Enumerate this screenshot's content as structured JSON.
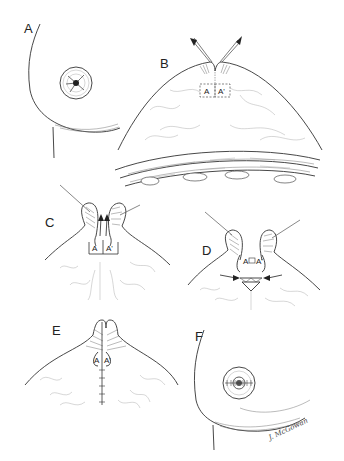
{
  "figure": {
    "panels": [
      {
        "id": "A",
        "label": "A",
        "content": "Breast with inverted nipple (frontal/oblique view)"
      },
      {
        "id": "B",
        "label": "B",
        "content": "Cross-section; nipple elevated with traction sutures (arrows); flaps A and A' outlined (dashed)",
        "flap_labels": [
          "A",
          "A'"
        ]
      },
      {
        "id": "C",
        "label": "C",
        "content": "Flaps A and A' raised, arrows showing advancement upward",
        "flap_labels": [
          "A",
          "A'"
        ]
      },
      {
        "id": "D",
        "label": "D",
        "content": "Flaps A and A' approximated beneath nipple; arrows pushing medially",
        "flap_labels": [
          "A",
          "A'"
        ]
      },
      {
        "id": "E",
        "label": "E",
        "content": "Closure with vertical suture line beneath everted nipple",
        "flap_labels": [
          "A",
          "A'"
        ]
      },
      {
        "id": "F",
        "label": "F",
        "content": "Final result with everted nipple and purse-string sutures"
      }
    ],
    "signature": "J. McGowan"
  }
}
